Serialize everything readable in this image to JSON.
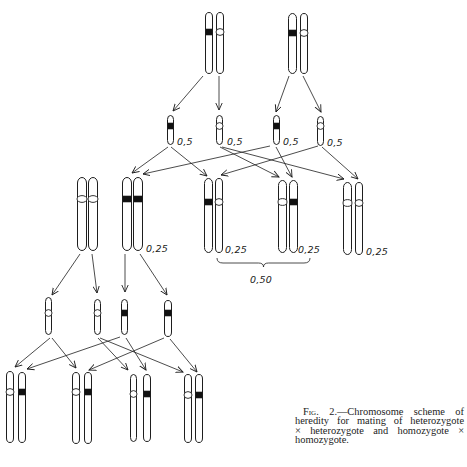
{
  "figure": {
    "stroke_color": "#1e1e1e",
    "band_fill_dominant": "#111111",
    "band_fill_recessive": "#ffffff",
    "cross_1": "heterozygote × heterozygote",
    "cross_2": "homozygote × homozygote",
    "chromosomes": [
      {
        "id": "p1-a",
        "group": "parent-1",
        "x": 205,
        "y": 12,
        "w": 8,
        "h": 62,
        "band": "black",
        "band_y": 32
      },
      {
        "id": "p1-b",
        "group": "parent-1",
        "x": 216,
        "y": 12,
        "w": 8,
        "h": 62,
        "band": "white",
        "band_y": 32
      },
      {
        "id": "p2-a",
        "group": "parent-2",
        "x": 288,
        "y": 13,
        "w": 9,
        "h": 61,
        "band": "black",
        "band_y": 33
      },
      {
        "id": "p2-b",
        "group": "parent-2",
        "x": 300,
        "y": 13,
        "w": 8,
        "h": 61,
        "band": "white",
        "band_y": 33
      },
      {
        "id": "g1",
        "group": "gamete-row-1",
        "x": 167,
        "y": 115,
        "w": 7,
        "h": 30,
        "band": "black",
        "band_y": 126
      },
      {
        "id": "g2",
        "group": "gamete-row-1",
        "x": 216,
        "y": 115,
        "w": 7,
        "h": 30,
        "band": "white",
        "band_y": 126
      },
      {
        "id": "g3",
        "group": "gamete-row-1",
        "x": 273,
        "y": 115,
        "w": 7,
        "h": 30,
        "band": "black",
        "band_y": 126
      },
      {
        "id": "g4",
        "group": "gamete-row-1",
        "x": 317,
        "y": 116,
        "w": 7,
        "h": 30,
        "band": "white",
        "band_y": 126
      },
      {
        "id": "d1",
        "group": "offspring-white-white-left",
        "x": 77,
        "y": 177,
        "w": 10,
        "h": 74,
        "band": "white",
        "band_y": 199
      },
      {
        "id": "d2",
        "group": "offspring-white-white-left",
        "x": 88,
        "y": 177,
        "w": 10,
        "h": 74,
        "band": "white",
        "band_y": 199
      },
      {
        "id": "e1",
        "group": "offspring-black-black",
        "x": 122,
        "y": 177,
        "w": 10,
        "h": 74,
        "band": "black",
        "band_y": 199
      },
      {
        "id": "e2",
        "group": "offspring-black-black",
        "x": 133,
        "y": 177,
        "w": 10,
        "h": 74,
        "band": "black",
        "band_y": 199
      },
      {
        "id": "a1",
        "group": "offspring-black-white",
        "x": 204,
        "y": 178,
        "w": 9,
        "h": 75,
        "band": "black",
        "band_y": 202
      },
      {
        "id": "a2",
        "group": "offspring-black-white",
        "x": 215,
        "y": 178,
        "w": 8,
        "h": 75,
        "band": "white",
        "band_y": 202
      },
      {
        "id": "b1",
        "group": "offspring-white-black",
        "x": 278,
        "y": 180,
        "w": 9,
        "h": 73,
        "band": "white",
        "band_y": 202
      },
      {
        "id": "b2",
        "group": "offspring-white-black",
        "x": 289,
        "y": 180,
        "w": 9,
        "h": 73,
        "band": "black",
        "band_y": 202
      },
      {
        "id": "c1",
        "group": "offspring-white-white",
        "x": 343,
        "y": 182,
        "w": 9,
        "h": 73,
        "band": "white",
        "band_y": 203
      },
      {
        "id": "c2",
        "group": "offspring-white-white",
        "x": 355,
        "y": 182,
        "w": 8,
        "h": 73,
        "band": "white",
        "band_y": 203
      },
      {
        "id": "g5",
        "group": "gamete-row-2",
        "x": 45,
        "y": 297,
        "w": 7,
        "h": 38,
        "band": "white",
        "band_y": 313
      },
      {
        "id": "g6",
        "group": "gamete-row-2",
        "x": 94,
        "y": 299,
        "w": 7,
        "h": 36,
        "band": "white",
        "band_y": 313
      },
      {
        "id": "g7",
        "group": "gamete-row-2",
        "x": 121,
        "y": 299,
        "w": 7,
        "h": 36,
        "band": "black",
        "band_y": 313
      },
      {
        "id": "g8",
        "group": "gamete-row-2",
        "x": 164,
        "y": 300,
        "w": 8,
        "h": 37,
        "band": "black",
        "band_y": 313
      },
      {
        "id": "f1",
        "group": "hybrid-1",
        "x": 6,
        "y": 371,
        "w": 8,
        "h": 72,
        "band": "white",
        "band_y": 392
      },
      {
        "id": "f2",
        "group": "hybrid-1",
        "x": 18,
        "y": 372,
        "w": 8,
        "h": 71,
        "band": "black",
        "band_y": 392
      },
      {
        "id": "h1",
        "group": "hybrid-2",
        "x": 72,
        "y": 372,
        "w": 8,
        "h": 72,
        "band": "white",
        "band_y": 392
      },
      {
        "id": "h2",
        "group": "hybrid-2",
        "x": 84,
        "y": 372,
        "w": 8,
        "h": 72,
        "band": "black",
        "band_y": 392
      },
      {
        "id": "i1",
        "group": "hybrid-3",
        "x": 130,
        "y": 374,
        "w": 7,
        "h": 68,
        "band": "white",
        "band_y": 394
      },
      {
        "id": "i2",
        "group": "hybrid-3",
        "x": 143,
        "y": 374,
        "w": 8,
        "h": 68,
        "band": "black",
        "band_y": 394
      },
      {
        "id": "j1",
        "group": "hybrid-4",
        "x": 184,
        "y": 374,
        "w": 8,
        "h": 69,
        "band": "white",
        "band_y": 395
      },
      {
        "id": "j2",
        "group": "hybrid-4",
        "x": 195,
        "y": 374,
        "w": 8,
        "h": 69,
        "band": "black",
        "band_y": 395
      }
    ],
    "arrows": [
      [
        203,
        76,
        173,
        111
      ],
      [
        219,
        76,
        219,
        110
      ],
      [
        289,
        76,
        276,
        112
      ],
      [
        303,
        76,
        321,
        112
      ],
      [
        168,
        147,
        132,
        173
      ],
      [
        171,
        147,
        207,
        176
      ],
      [
        220,
        147,
        279,
        177
      ],
      [
        222,
        147,
        344,
        179
      ],
      [
        270,
        146,
        143,
        174
      ],
      [
        276,
        147,
        292,
        177
      ],
      [
        318,
        146,
        221,
        175
      ],
      [
        322,
        147,
        358,
        179
      ],
      [
        80,
        254,
        52,
        295
      ],
      [
        92,
        254,
        97,
        293
      ],
      [
        125,
        254,
        125,
        292
      ],
      [
        140,
        254,
        167,
        295
      ],
      [
        50,
        338,
        15,
        367
      ],
      [
        52,
        338,
        76,
        368
      ],
      [
        98,
        338,
        128,
        370
      ],
      [
        100,
        338,
        183,
        372
      ],
      [
        120,
        337,
        27,
        369
      ],
      [
        126,
        338,
        146,
        370
      ],
      [
        164,
        338,
        89,
        370
      ],
      [
        170,
        339,
        197,
        372
      ]
    ],
    "labels": [
      {
        "text": "0,5",
        "x": 177,
        "y": 145,
        "target": "g1"
      },
      {
        "text": "0,5",
        "x": 227,
        "y": 145,
        "target": "g2"
      },
      {
        "text": "0,5",
        "x": 283,
        "y": 145,
        "target": "g3"
      },
      {
        "text": "0,5",
        "x": 327,
        "y": 146,
        "target": "g4"
      },
      {
        "text": "0,25",
        "x": 146,
        "y": 252,
        "target": "e"
      },
      {
        "text": "0,25",
        "x": 225,
        "y": 253,
        "target": "a"
      },
      {
        "text": "0,25",
        "x": 298,
        "y": 253,
        "target": "b"
      },
      {
        "text": "0,25",
        "x": 366,
        "y": 255,
        "target": "c"
      },
      {
        "text": "0,50",
        "x": 250,
        "y": 283,
        "target": "brace"
      }
    ],
    "brace": {
      "x1": 217,
      "x2": 310,
      "y_top": 258,
      "y_mid": 263,
      "tip_y": 267
    }
  },
  "caption": {
    "lines": [
      {
        "prefix": "Fig.",
        "text": " 2.—Chromosome scheme of"
      },
      {
        "prefix": "",
        "text": "heredity for mating of heterozygote"
      },
      {
        "prefix": "",
        "text": "× heterozygote and homozygote ×"
      },
      {
        "prefix": "",
        "text": "homozygote."
      }
    ]
  }
}
